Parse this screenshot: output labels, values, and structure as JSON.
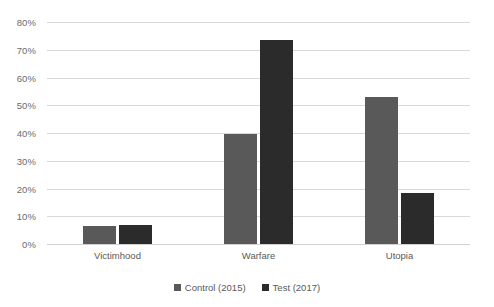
{
  "chart_data": {
    "type": "bar",
    "title": "",
    "subtitle": "",
    "xlabel": "",
    "ylabel": "",
    "categories": [
      "Victimhood",
      "Warfare",
      "Utopia"
    ],
    "series": [
      {
        "name": "Control (2015)",
        "color": "#595959",
        "values": [
          6.5,
          39.5,
          53
        ]
      },
      {
        "name": "Test (2017)",
        "color": "#2b2b2b",
        "values": [
          7,
          73.5,
          18.5
        ]
      }
    ],
    "ylim": [
      0,
      80
    ],
    "y_ticks": [
      0,
      10,
      20,
      30,
      40,
      50,
      60,
      70,
      80
    ],
    "y_tick_labels": [
      "0%",
      "10%",
      "20%",
      "30%",
      "40%",
      "50%",
      "60%",
      "70%",
      "80%"
    ],
    "value_suffix": "%",
    "grid": true,
    "grid_color": "#d9d9d9",
    "legend_position": "bottom",
    "background_color": "#ffffff"
  }
}
